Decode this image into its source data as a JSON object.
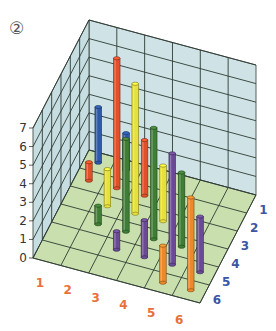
{
  "figure_label": "②",
  "colors": {
    "back_wall": "#cfe3e6",
    "side_wall": "#c6dde1",
    "floor": "#c9dfae",
    "grid": "#2f3b33",
    "x_tick_color": "#e8703a",
    "depth_tick_color": "#3a56a5",
    "z_tick_color": "#333333"
  },
  "chart_data": {
    "type": "bar3d",
    "title": "",
    "x_ticks": [
      "1",
      "2",
      "3",
      "4",
      "5",
      "6"
    ],
    "depth_ticks": [
      "1",
      "2",
      "3",
      "4",
      "5",
      "6"
    ],
    "z_ticks": [
      "0",
      "1",
      "2",
      "3",
      "4",
      "5",
      "6",
      "7"
    ],
    "zlim": [
      0,
      7
    ],
    "grid": true,
    "row_colors": {
      "1": "#2d5aa8",
      "2": "#e0502a",
      "3": "#e8e03a",
      "4": "#3f7f35",
      "5": "#6a4a94",
      "6": "#ea8a2a"
    },
    "bars": [
      {
        "x": 1,
        "row": 1,
        "height": 3
      },
      {
        "x": 2,
        "row": 1,
        "height": 2
      },
      {
        "x": 1,
        "row": 2,
        "height": 1
      },
      {
        "x": 2,
        "row": 2,
        "height": 7
      },
      {
        "x": 3,
        "row": 2,
        "height": 3
      },
      {
        "x": 2,
        "row": 3,
        "height": 2
      },
      {
        "x": 3,
        "row": 3,
        "height": 7
      },
      {
        "x": 4,
        "row": 3,
        "height": 3
      },
      {
        "x": 2,
        "row": 4,
        "height": 1
      },
      {
        "x": 3,
        "row": 4,
        "height": 5
      },
      {
        "x": 4,
        "row": 4,
        "height": 6
      },
      {
        "x": 5,
        "row": 4,
        "height": 4
      },
      {
        "x": 3,
        "row": 5,
        "height": 1
      },
      {
        "x": 4,
        "row": 5,
        "height": 2
      },
      {
        "x": 5,
        "row": 5,
        "height": 6
      },
      {
        "x": 6,
        "row": 5,
        "height": 3
      },
      {
        "x": 5,
        "row": 6,
        "height": 2
      },
      {
        "x": 6,
        "row": 6,
        "height": 5
      }
    ]
  }
}
